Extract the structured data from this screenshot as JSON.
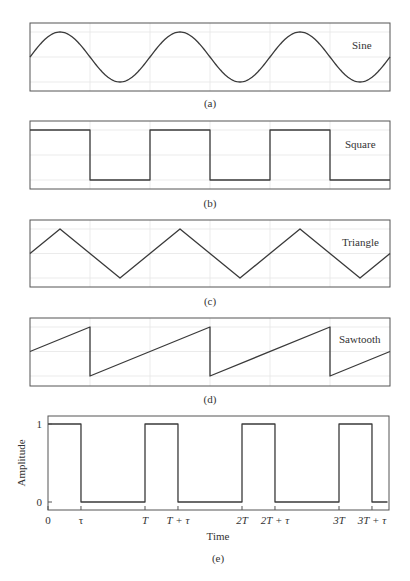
{
  "chart_data": [
    {
      "type": "line",
      "panel": "a",
      "caption": "(a)",
      "label": "Sine",
      "waveform": "sine",
      "periods": 3,
      "start_phase": 0,
      "ylim": [
        -1,
        1
      ],
      "grid": true,
      "legend_position": "top-right",
      "x": [
        0,
        0.25,
        0.5,
        0.75,
        1,
        1.25,
        1.5,
        1.75,
        2,
        2.25,
        2.5,
        2.75,
        3
      ],
      "y": [
        0,
        1,
        0,
        -1,
        0,
        1,
        0,
        -1,
        0,
        1,
        0,
        -1,
        0
      ]
    },
    {
      "type": "line",
      "panel": "b",
      "caption": "(b)",
      "label": "Square",
      "waveform": "square",
      "periods": 3,
      "duty_cycle": 0.5,
      "ylim": [
        -1,
        1
      ],
      "grid": true,
      "legend_position": "top-right",
      "x": [
        0,
        0.5,
        0.5,
        1,
        1,
        1.5,
        1.5,
        2,
        2,
        2.5,
        2.5,
        3
      ],
      "y": [
        1,
        1,
        -1,
        -1,
        1,
        1,
        -1,
        -1,
        1,
        1,
        -1,
        -1
      ]
    },
    {
      "type": "line",
      "panel": "c",
      "caption": "(c)",
      "label": "Triangle",
      "waveform": "triangle",
      "periods": 3,
      "ylim": [
        -1,
        1
      ],
      "grid": true,
      "legend_position": "top-right",
      "x": [
        0,
        0.25,
        0.75,
        1.25,
        1.75,
        2.25,
        2.75,
        3
      ],
      "y": [
        0,
        1,
        -1,
        1,
        -1,
        1,
        -1,
        0
      ]
    },
    {
      "type": "line",
      "panel": "d",
      "caption": "(d)",
      "label": "Sawtooth",
      "waveform": "sawtooth",
      "periods": 3,
      "ylim": [
        -1,
        1
      ],
      "grid": true,
      "legend_position": "top-right",
      "x": [
        0,
        0.5,
        0.5,
        1.5,
        1.5,
        2.5,
        2.5,
        3
      ],
      "y": [
        0,
        1,
        -1,
        1,
        -1,
        1,
        -1,
        0
      ]
    },
    {
      "type": "line",
      "panel": "e",
      "caption": "(e)",
      "label": "",
      "waveform": "pulse",
      "periods": 3,
      "duty_cycle": 0.34,
      "xlabel": "Time",
      "ylabel": "Amplitude",
      "ylim": [
        0,
        1
      ],
      "xlim": [
        0,
        3.5
      ],
      "grid": false,
      "y_ticks": [
        {
          "value": 0,
          "label": "0"
        },
        {
          "value": 1,
          "label": "1"
        }
      ],
      "x_ticks": [
        {
          "value": 0,
          "label": "0"
        },
        {
          "value": 0.34,
          "label": "τ"
        },
        {
          "value": 1,
          "label": "T"
        },
        {
          "value": 1.34,
          "label": "T + τ"
        },
        {
          "value": 2,
          "label": "2T"
        },
        {
          "value": 2.34,
          "label": "2T + τ"
        },
        {
          "value": 3,
          "label": "3T"
        },
        {
          "value": 3.34,
          "label": "3T + τ"
        }
      ],
      "x": [
        0,
        0.34,
        0.34,
        1,
        1,
        1.34,
        1.34,
        2,
        2,
        2.34,
        2.34,
        3,
        3,
        3.34,
        3.34,
        3.5
      ],
      "y": [
        1,
        1,
        0,
        0,
        1,
        1,
        0,
        0,
        1,
        1,
        0,
        0,
        1,
        1,
        0,
        0
      ]
    }
  ]
}
